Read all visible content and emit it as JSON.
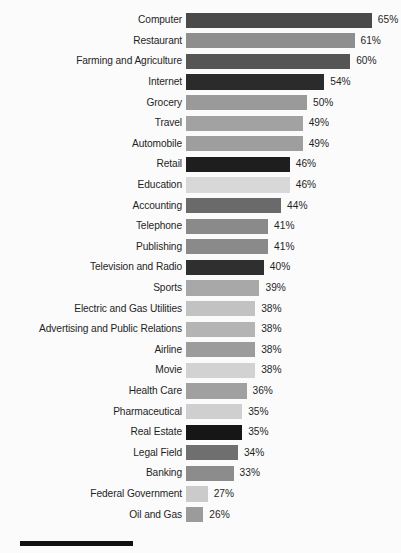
{
  "chart_data": {
    "type": "bar",
    "orientation": "horizontal",
    "title": "",
    "xlabel": "",
    "ylabel": "",
    "xlim": [
      0,
      70
    ],
    "grid": false,
    "legend": false,
    "value_suffix": "%",
    "categories": [
      "Computer",
      "Restaurant",
      "Farming and Agriculture",
      "Internet",
      "Grocery",
      "Travel",
      "Automobile",
      "Retail",
      "Education",
      "Accounting",
      "Telephone",
      "Publishing",
      "Television and Radio",
      "Sports",
      "Electric and Gas Utilities",
      "Advertising and Public Relations",
      "Airline",
      "Movie",
      "Health Care",
      "Pharmaceutical",
      "Real Estate",
      "Legal Field",
      "Banking",
      "Federal Government",
      "Oil and Gas"
    ],
    "values": [
      65,
      61,
      60,
      54,
      50,
      49,
      49,
      46,
      46,
      44,
      41,
      41,
      40,
      39,
      38,
      38,
      38,
      38,
      36,
      35,
      35,
      34,
      33,
      27,
      26
    ],
    "value_labels": [
      "65%",
      "61%",
      "60%",
      "54%",
      "50%",
      "49%",
      "49%",
      "46%",
      "46%",
      "44%",
      "41%",
      "41%",
      "40%",
      "39%",
      "38%",
      "38%",
      "38%",
      "38%",
      "36%",
      "35%",
      "35%",
      "34%",
      "33%",
      "27%",
      "26%"
    ],
    "bar_colors": [
      "#4a4a4a",
      "#8e8e8e",
      "#555555",
      "#2b2b2b",
      "#9a9a9a",
      "#a2a2a2",
      "#9e9e9e",
      "#1e1e1e",
      "#d8d8d8",
      "#6a6a6a",
      "#8a8a8a",
      "#8a8a8a",
      "#2f2f2f",
      "#a8a8a8",
      "#c2c2c2",
      "#b4b4b4",
      "#9c9c9c",
      "#d2d2d2",
      "#a0a0a0",
      "#cfcfcf",
      "#161616",
      "#6f6f6f",
      "#8c8c8c",
      "#cbcbcb",
      "#9b9b9b"
    ]
  },
  "footer": {
    "rule_color": "#111111"
  }
}
